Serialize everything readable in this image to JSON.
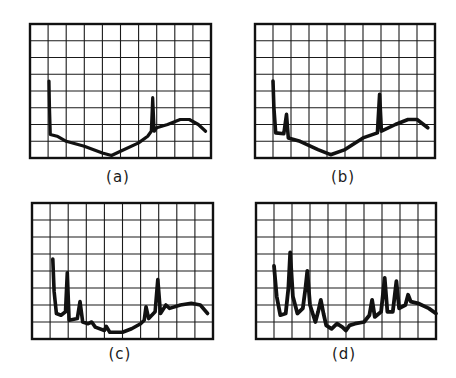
{
  "figure": {
    "colors": {
      "ink": "#111111",
      "grid": "#1a1a1a",
      "background": "#ffffff"
    },
    "grid": {
      "columns": 10,
      "rows": 8
    },
    "panels": [
      {
        "id": "a",
        "label": "(a)",
        "box": {
          "x": 30,
          "y": 24,
          "w": 181,
          "h": 134
        },
        "caption_pos": {
          "x": 88,
          "y": 168
        },
        "trace_width": 3.2
      },
      {
        "id": "b",
        "label": "(b)",
        "box": {
          "x": 255,
          "y": 24,
          "w": 180,
          "h": 134
        },
        "caption_pos": {
          "x": 313,
          "y": 168
        },
        "trace_width": 3.6
      },
      {
        "id": "c",
        "label": "(c)",
        "box": {
          "x": 32,
          "y": 203,
          "w": 181,
          "h": 136
        },
        "caption_pos": {
          "x": 90,
          "y": 345
        },
        "trace_width": 3.6
      },
      {
        "id": "d",
        "label": "(d)",
        "box": {
          "x": 256,
          "y": 203,
          "w": 180,
          "h": 136
        },
        "caption_pos": {
          "x": 314,
          "y": 345
        },
        "trace_width": 3.8
      }
    ]
  },
  "chart_data": [
    {
      "type": "line",
      "title": "(a)",
      "xlabel": "",
      "ylabel": "",
      "xlim": [
        0,
        10
      ],
      "ylim": [
        0,
        8
      ],
      "grid": true,
      "series": [
        {
          "name": "spectrum a",
          "points": [
            [
              1.05,
              4.6
            ],
            [
              1.08,
              3.0
            ],
            [
              1.12,
              1.4
            ],
            [
              1.5,
              1.3
            ],
            [
              2,
              1.0
            ],
            [
              3,
              0.7
            ],
            [
              4,
              0.3
            ],
            [
              4.5,
              0.15
            ],
            [
              5,
              0.4
            ],
            [
              6,
              0.9
            ],
            [
              6.5,
              1.3
            ],
            [
              6.7,
              1.6
            ],
            [
              6.78,
              3.6
            ],
            [
              6.86,
              1.6
            ],
            [
              7,
              1.8
            ],
            [
              7.6,
              2.0
            ],
            [
              8.3,
              2.3
            ],
            [
              8.8,
              2.3
            ],
            [
              9.3,
              2.0
            ],
            [
              9.7,
              1.6
            ]
          ]
        }
      ]
    },
    {
      "type": "line",
      "title": "(b)",
      "xlabel": "",
      "ylabel": "",
      "xlim": [
        0,
        10
      ],
      "ylim": [
        0,
        8
      ],
      "grid": true,
      "series": [
        {
          "name": "spectrum b",
          "points": [
            [
              1.0,
              4.6
            ],
            [
              1.05,
              3.0
            ],
            [
              1.15,
              1.5
            ],
            [
              1.6,
              1.45
            ],
            [
              1.75,
              2.6
            ],
            [
              1.85,
              1.2
            ],
            [
              2.5,
              1.0
            ],
            [
              3.5,
              0.5
            ],
            [
              4.2,
              0.2
            ],
            [
              5,
              0.5
            ],
            [
              6,
              1.2
            ],
            [
              6.8,
              1.5
            ],
            [
              6.92,
              3.8
            ],
            [
              7.02,
              1.6
            ],
            [
              7.8,
              2.0
            ],
            [
              8.5,
              2.3
            ],
            [
              9.0,
              2.3
            ],
            [
              9.6,
              1.8
            ]
          ]
        }
      ]
    },
    {
      "type": "line",
      "title": "(c)",
      "xlabel": "",
      "ylabel": "",
      "xlim": [
        0,
        10
      ],
      "ylim": [
        0,
        8
      ],
      "grid": true,
      "series": [
        {
          "name": "spectrum c",
          "points": [
            [
              1.15,
              4.7
            ],
            [
              1.22,
              2.8
            ],
            [
              1.35,
              1.5
            ],
            [
              1.6,
              1.4
            ],
            [
              1.85,
              1.6
            ],
            [
              1.95,
              3.9
            ],
            [
              2.05,
              1.1
            ],
            [
              2.5,
              1.2
            ],
            [
              2.65,
              2.2
            ],
            [
              2.8,
              1.0
            ],
            [
              3.1,
              0.9
            ],
            [
              3.3,
              1.0
            ],
            [
              3.5,
              0.7
            ],
            [
              4.0,
              0.5
            ],
            [
              4.1,
              0.75
            ],
            [
              4.3,
              0.4
            ],
            [
              5,
              0.4
            ],
            [
              5.5,
              0.6
            ],
            [
              6,
              0.9
            ],
            [
              6.2,
              1.1
            ],
            [
              6.3,
              1.9
            ],
            [
              6.45,
              1.2
            ],
            [
              6.8,
              1.6
            ],
            [
              6.95,
              3.5
            ],
            [
              7.1,
              1.5
            ],
            [
              7.4,
              2.0
            ],
            [
              7.6,
              1.8
            ],
            [
              8.2,
              2.0
            ],
            [
              8.8,
              2.1
            ],
            [
              9.3,
              2.0
            ],
            [
              9.7,
              1.5
            ]
          ]
        }
      ]
    },
    {
      "type": "line",
      "title": "(d)",
      "xlabel": "",
      "ylabel": "",
      "xlim": [
        0,
        10
      ],
      "ylim": [
        0,
        8
      ],
      "grid": true,
      "series": [
        {
          "name": "spectrum d",
          "points": [
            [
              1.0,
              4.3
            ],
            [
              1.15,
              2.5
            ],
            [
              1.35,
              1.4
            ],
            [
              1.65,
              1.5
            ],
            [
              1.8,
              3.0
            ],
            [
              1.9,
              5.1
            ],
            [
              2.05,
              2.5
            ],
            [
              2.3,
              1.5
            ],
            [
              2.6,
              1.8
            ],
            [
              2.75,
              3.0
            ],
            [
              2.85,
              4.0
            ],
            [
              3.0,
              2.0
            ],
            [
              3.3,
              1.0
            ],
            [
              3.45,
              1.6
            ],
            [
              3.6,
              2.3
            ],
            [
              3.75,
              1.5
            ],
            [
              3.9,
              0.8
            ],
            [
              4.2,
              0.6
            ],
            [
              4.5,
              0.9
            ],
            [
              4.8,
              0.7
            ],
            [
              5.0,
              0.5
            ],
            [
              5.2,
              0.8
            ],
            [
              5.5,
              0.9
            ],
            [
              6.0,
              1.0
            ],
            [
              6.3,
              1.4
            ],
            [
              6.45,
              2.3
            ],
            [
              6.6,
              1.3
            ],
            [
              6.95,
              1.6
            ],
            [
              7.15,
              3.6
            ],
            [
              7.3,
              1.6
            ],
            [
              7.6,
              1.6
            ],
            [
              7.8,
              3.4
            ],
            [
              7.95,
              1.8
            ],
            [
              8.3,
              2.0
            ],
            [
              8.45,
              2.6
            ],
            [
              8.6,
              2.2
            ],
            [
              9.0,
              2.1
            ],
            [
              9.6,
              1.8
            ],
            [
              10.0,
              1.5
            ]
          ]
        }
      ]
    }
  ]
}
